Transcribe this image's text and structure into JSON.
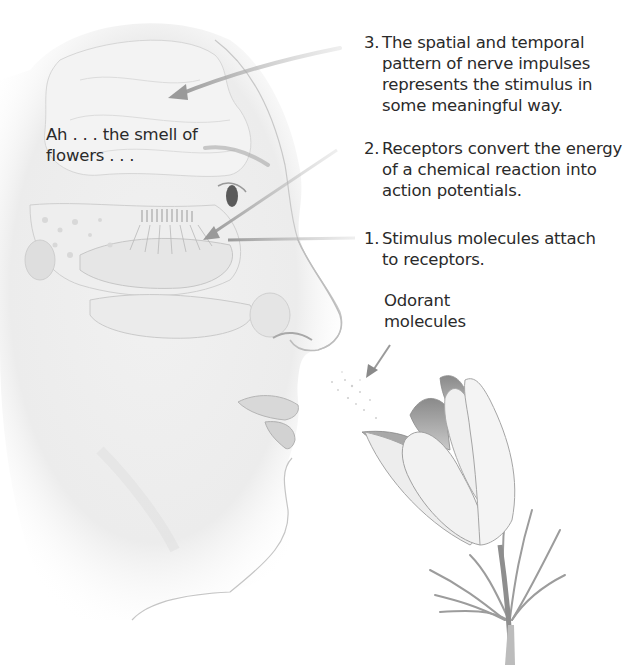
{
  "figure": {
    "colors": {
      "background": "#ffffff",
      "text": "#2a2a2a",
      "arrow": "#9a9a9a",
      "sketch_line": "#b5b5b5",
      "shade": "#d9d9d9"
    }
  },
  "speech": {
    "line1": "Ah . . . the smell of",
    "line2": "flowers . . ."
  },
  "steps": [
    {
      "number": "3.",
      "lines": [
        "The spatial and temporal",
        "pattern of nerve impulses",
        "represents the stimulus in",
        "some meaningful way."
      ]
    },
    {
      "number": "2.",
      "lines": [
        "Receptors convert the energy",
        "of a chemical reaction into",
        "action potentials."
      ]
    },
    {
      "number": "1.",
      "lines": [
        "Stimulus molecules attach",
        "to receptors."
      ]
    }
  ],
  "odorant_label": {
    "line1": "Odorant",
    "line2": "molecules"
  }
}
